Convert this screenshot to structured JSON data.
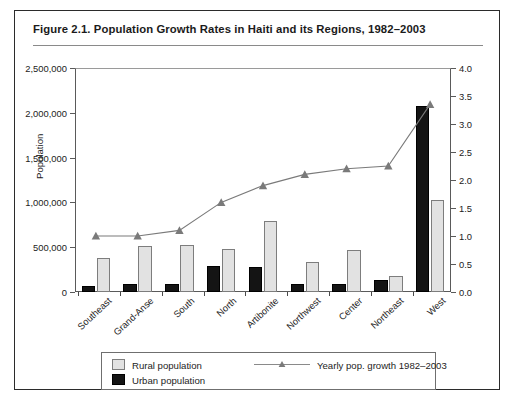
{
  "figure": {
    "title": "Figure 2.1.  Population Growth Rates in Haiti and its Regions, 1982–2003"
  },
  "chart_data": {
    "type": "bar",
    "title": "Figure 2.1.  Population Growth Rates in Haiti and its Regions, 1982–2003",
    "xlabel": "",
    "ylabel": "Population",
    "y2label": "",
    "ylim": [
      0,
      2500000
    ],
    "y2lim": [
      0,
      4.0
    ],
    "yticks": [
      0,
      500000,
      1000000,
      1500000,
      2000000,
      2500000
    ],
    "ytick_labels": [
      "0",
      "500,000",
      "1,000,000",
      "1,500,000",
      "2,000,000",
      "2,500,000"
    ],
    "y2ticks": [
      0.0,
      0.5,
      1.0,
      1.5,
      2.0,
      2.5,
      3.0,
      3.5,
      4.0
    ],
    "y2tick_labels": [
      "0.0",
      "0.5",
      "1.0",
      "1.5",
      "2.0",
      "2.5",
      "3.0",
      "3.5",
      "4.0"
    ],
    "grid": false,
    "legend_position": "bottom",
    "categories": [
      "Southeast",
      "Grand-Anse",
      "South",
      "North",
      "Artibonite",
      "Northwest",
      "Center",
      "Northeast",
      "West"
    ],
    "series": [
      {
        "name": "Urban population",
        "type": "bar",
        "axis": "left",
        "color": "#141414",
        "values": [
          65000,
          85000,
          95000,
          290000,
          280000,
          95000,
          85000,
          130000,
          2080000
        ]
      },
      {
        "name": "Rural population",
        "type": "bar",
        "axis": "left",
        "color": "#e2e2e2",
        "values": [
          385000,
          510000,
          525000,
          475000,
          790000,
          340000,
          470000,
          180000,
          1030000
        ]
      },
      {
        "name": "Yearly pop. growth 1982–2003",
        "type": "line",
        "axis": "right",
        "color": "#7a7a7a",
        "values": [
          1.0,
          1.0,
          1.1,
          1.6,
          1.9,
          2.1,
          2.2,
          2.25,
          3.35
        ]
      }
    ]
  },
  "legend": {
    "rural_label": "Rural population",
    "urban_label": "Urban population",
    "growth_label": "Yearly pop. growth 1982–2003"
  },
  "colors": {
    "urban": "#141414",
    "rural": "#e2e2e2",
    "line": "#7a7a7a",
    "frame": "#2b2b2b"
  }
}
